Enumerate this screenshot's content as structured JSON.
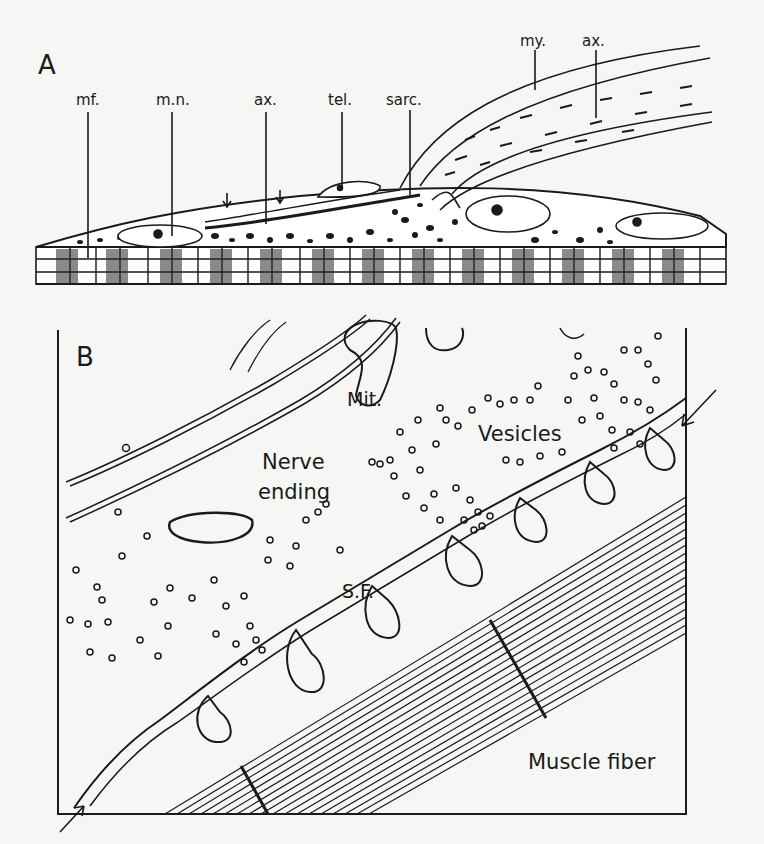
{
  "panel_a": {
    "letter": "A",
    "labels": {
      "mf": "mf.",
      "mn": "m.n.",
      "ax1": "ax.",
      "tel": "tel.",
      "sarc": "sarc.",
      "my": "my.",
      "ax2": "ax."
    }
  },
  "panel_b": {
    "letter": "B",
    "labels": {
      "mit": "Mit.",
      "vesicles": "Vesicles",
      "nerve": "Nerve",
      "ending": "ending",
      "sf": "S.F.",
      "muscle": "Muscle fiber"
    }
  },
  "colors": {
    "ink": "#1a1a1a",
    "paper": "#f6f6f4"
  }
}
